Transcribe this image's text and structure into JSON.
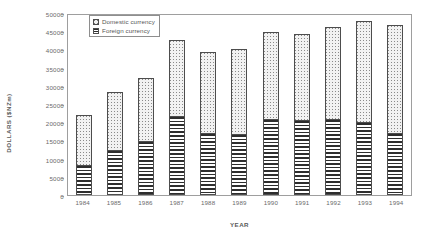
{
  "chart_data": {
    "type": "bar",
    "stacked": true,
    "title": "",
    "xlabel": "YEAR",
    "ylabel": "DOLLARS ($NZm)",
    "ylim": [
      0,
      50000
    ],
    "ytick_step": 5000,
    "yticks": [
      0,
      5000,
      10000,
      15000,
      20000,
      25000,
      30000,
      35000,
      40000,
      45000,
      50000
    ],
    "ytick_labels": [
      "0",
      "5000",
      "10000",
      "15000",
      "20000",
      "25000",
      "30000",
      "35000",
      "40000",
      "45000",
      "50000"
    ],
    "grid": false,
    "legend_position": "top-left-inside",
    "categories": [
      "1984",
      "1985",
      "1986",
      "1987",
      "1988",
      "1989",
      "1990",
      "1991",
      "1992",
      "1993",
      "1994"
    ],
    "series": [
      {
        "name": "Foreign currency",
        "fill": "horizontal-stripes",
        "values": [
          8200,
          12400,
          14900,
          21700,
          17100,
          16700,
          20800,
          20700,
          20900,
          20000,
          17100
        ]
      },
      {
        "name": "Domestic currency",
        "fill": "dotted-stipple",
        "values": [
          13800,
          15900,
          17300,
          21000,
          22100,
          23300,
          23900,
          23500,
          25300,
          27800,
          29600
        ]
      }
    ],
    "totals": [
      22000,
      28300,
      32200,
      42700,
      39200,
      40000,
      44700,
      44200,
      46200,
      47800,
      46700
    ]
  },
  "legend": {
    "items": [
      {
        "label": "Domestic currency",
        "swatch": "dotted-stipple"
      },
      {
        "label": "Foreign currency",
        "swatch": "horizontal-stripes"
      }
    ]
  },
  "colors": {
    "axis": "#9e9e9e",
    "text": "#6a6a6a",
    "bar_outline": "#4d4d4d",
    "foreign_stripe": "#2e2e2e",
    "domestic_fill": "#f2f2f2"
  }
}
